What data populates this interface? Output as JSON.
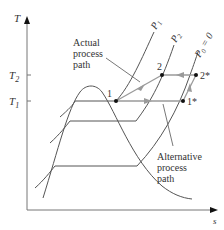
{
  "diagram": {
    "type": "T-s diagram",
    "axes": {
      "y_label": "T",
      "x_label": "s",
      "y_ticks": [
        {
          "label": "T",
          "sub": "2"
        },
        {
          "label": "T",
          "sub": "1"
        }
      ]
    },
    "isobars": [
      {
        "label": "P",
        "sub": "1",
        "suffix": ""
      },
      {
        "label": "P",
        "sub": "2",
        "suffix": ""
      },
      {
        "label": "P",
        "sub": "0",
        "suffix": " = 0"
      }
    ],
    "points": [
      {
        "id": "p1",
        "label": "1"
      },
      {
        "id": "p2",
        "label": "2"
      },
      {
        "id": "p2s",
        "label": "2*"
      },
      {
        "id": "p1s",
        "label": "1*"
      }
    ],
    "annotations": {
      "actual": [
        "Actual",
        "process",
        "path"
      ],
      "alternative": [
        "Alternative",
        "process",
        "path"
      ]
    },
    "colors": {
      "line": "#555555",
      "arrow": "#9a9a9a",
      "point": "#111111"
    }
  }
}
